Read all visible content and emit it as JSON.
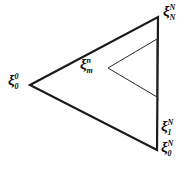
{
  "figure": {
    "background_color": "#ffffff",
    "stroke_color": "#1a1a1a",
    "title": "",
    "outer_triangle": {
      "name": "outer-triangle",
      "vertices": [
        [
          30,
          85
        ],
        [
          158,
          17
        ],
        [
          157,
          150
        ]
      ],
      "stroke_width": 2.2
    },
    "inner_triangle": {
      "name": "inner-triangle",
      "vertices": [
        [
          108,
          68
        ],
        [
          157,
          39
        ],
        [
          157,
          97
        ]
      ],
      "stroke_width": 1.0
    },
    "labels": [
      {
        "id": "xi-0-0",
        "name": "label-xi-0-superscript-0",
        "base": "ξ",
        "sup": "0",
        "sub": "0",
        "x": 8,
        "y": 72
      },
      {
        "id": "xi-N-N",
        "name": "label-xi-N-superscript-N",
        "base": "ξ",
        "sup": "N",
        "sub": "N",
        "x": 163,
        "y": 3
      },
      {
        "id": "xi-m-n",
        "name": "label-xi-m-superscript-n",
        "base": "ξ",
        "sup": "n",
        "sub": "m",
        "x": 80,
        "y": 56
      },
      {
        "id": "xi-1-N",
        "name": "label-xi-1-superscript-N",
        "base": "ξ",
        "sup": "N",
        "sub": "1",
        "x": 161,
        "y": 118
      },
      {
        "id": "xi-0-N",
        "name": "label-xi-0-superscript-N",
        "base": "ξ",
        "sup": "N",
        "sub": "0",
        "x": 161,
        "y": 139
      }
    ]
  }
}
